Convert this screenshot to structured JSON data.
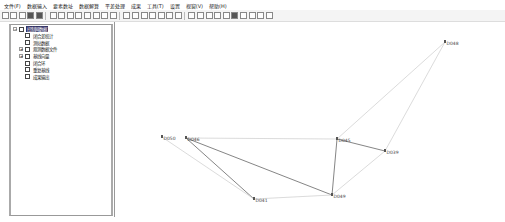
{
  "menubar": {
    "items": [
      "文件(F)",
      "数据输入",
      "要素数址",
      "数据解算",
      "平差处理",
      "成果",
      "工具(T)",
      "设置",
      "视窗(V)",
      "帮助(H)"
    ]
  },
  "toolbar": {
    "buttons": [
      "new-icon",
      "open-icon",
      "save-icon",
      "save-as-icon",
      "print-icon",
      "edit-icon",
      "table-icon",
      "table-icon",
      "table-icon",
      "table-icon",
      "circle-icon",
      "line-icon",
      "settings-icon",
      "select-icon",
      "zoom-window-icon",
      "zoom-in-icon",
      "zoom-out-icon",
      "pan-icon",
      "move-icon",
      "redo-icon",
      "compute-icon",
      "text-icon",
      "table-icon",
      "chart-icon",
      "mark-icon",
      "globe-icon",
      "grid-icon",
      "grid-icon",
      "grid-icon",
      "grid-icon"
    ]
  },
  "tree": {
    "items": [
      {
        "label": "控制网数据",
        "level": 0,
        "expander": "−",
        "icon": "network-icon",
        "selected": true
      },
      {
        "label": "闭合差统计",
        "level": 1,
        "icon": "table-icon"
      },
      {
        "label": "测站数据",
        "level": 1,
        "icon": "station-icon"
      },
      {
        "label": "观测数据文件",
        "level": 1,
        "expander": "+",
        "icon": "file-icon"
      },
      {
        "label": "基线向量",
        "level": 1,
        "expander": "+",
        "icon": "baseline-icon"
      },
      {
        "label": "闭合环",
        "level": 1,
        "icon": "loop-icon"
      },
      {
        "label": "重复基线",
        "level": 1,
        "icon": "repeat-icon"
      },
      {
        "label": "成果输出",
        "level": 1,
        "icon": "output-icon"
      }
    ]
  },
  "network": {
    "line_color_dark": "#777777",
    "line_color_light": "#cccccc",
    "points": [
      {
        "id": "D050",
        "x": 47,
        "y": 115
      },
      {
        "id": "D046",
        "x": 71,
        "y": 116
      },
      {
        "id": "D041",
        "x": 139,
        "y": 177
      },
      {
        "id": "D049",
        "x": 217,
        "y": 173
      },
      {
        "id": "D045",
        "x": 222,
        "y": 117
      },
      {
        "id": "D039",
        "x": 270,
        "y": 129
      },
      {
        "id": "D048",
        "x": 330,
        "y": 20
      }
    ],
    "edges": [
      {
        "from": "D048",
        "to": "D045",
        "style": "light"
      },
      {
        "from": "D048",
        "to": "D039",
        "style": "light"
      },
      {
        "from": "D045",
        "to": "D039",
        "style": "dark"
      },
      {
        "from": "D045",
        "to": "D049",
        "style": "dark"
      },
      {
        "from": "D039",
        "to": "D049",
        "style": "light"
      },
      {
        "from": "D046",
        "to": "D045",
        "style": "light"
      },
      {
        "from": "D046",
        "to": "D049",
        "style": "dark"
      },
      {
        "from": "D046",
        "to": "D041",
        "style": "dark"
      },
      {
        "from": "D050",
        "to": "D041",
        "style": "light"
      },
      {
        "from": "D041",
        "to": "D049",
        "style": "light"
      }
    ]
  }
}
